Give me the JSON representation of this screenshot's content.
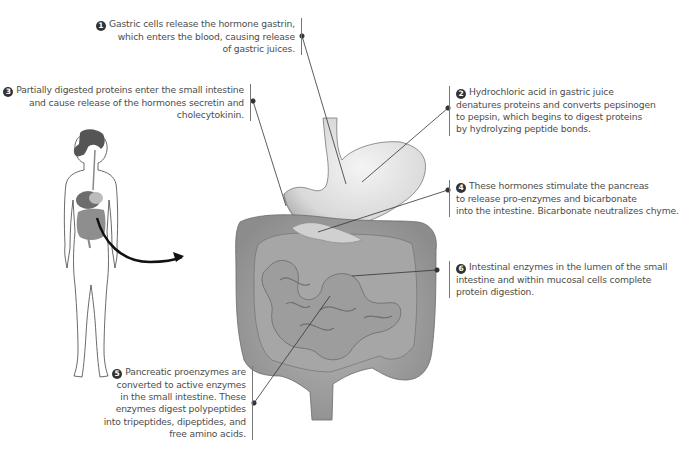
{
  "figure": {
    "annotations": [
      {
        "number": "1",
        "lines": [
          "Gastric cells release the hormone gastrin,",
          "which enters the blood, causing release",
          "of gastric juices."
        ],
        "target": "stomach"
      },
      {
        "number": "2",
        "lines": [
          "Hydrochloric acid in gastric juice",
          "denatures proteins and converts pepsinogen",
          "to pepsin, which begins to digest proteins",
          "by hydrolyzing peptide bonds."
        ],
        "target": "stomach-body"
      },
      {
        "number": "3",
        "lines": [
          "Partially digested proteins enter the small intestine",
          "and cause release of the hormones secretin and",
          "cholecytokinin."
        ],
        "target": "duodenum"
      },
      {
        "number": "4",
        "lines": [
          "These hormones stimulate the pancreas",
          "to release pro-enzymes and bicarbonate",
          "into the intestine.  Bicarbonate neutralizes chyme."
        ],
        "target": "pancreas"
      },
      {
        "number": "5",
        "lines": [
          "Pancreatic proenzymes are",
          "converted to active enzymes",
          "in the small intestine. These",
          "enzymes digest polypeptides",
          "into tripeptides, dipeptides, and",
          "free amino acids."
        ],
        "target": "small-intestine"
      },
      {
        "number": "6",
        "lines": [
          "Intestinal enzymes in the lumen of the small",
          "intestine and within mucosal cells complete",
          "protein digestion."
        ],
        "target": "small-intestine-lumen"
      }
    ],
    "colors": {
      "organ_fill": "#c9c9c9",
      "organ_dark": "#8a8a8a",
      "stomach_light": "#e6e6e6",
      "leader_line": "#333333",
      "text": "#4d4d4d",
      "arrow": "#111111"
    }
  }
}
